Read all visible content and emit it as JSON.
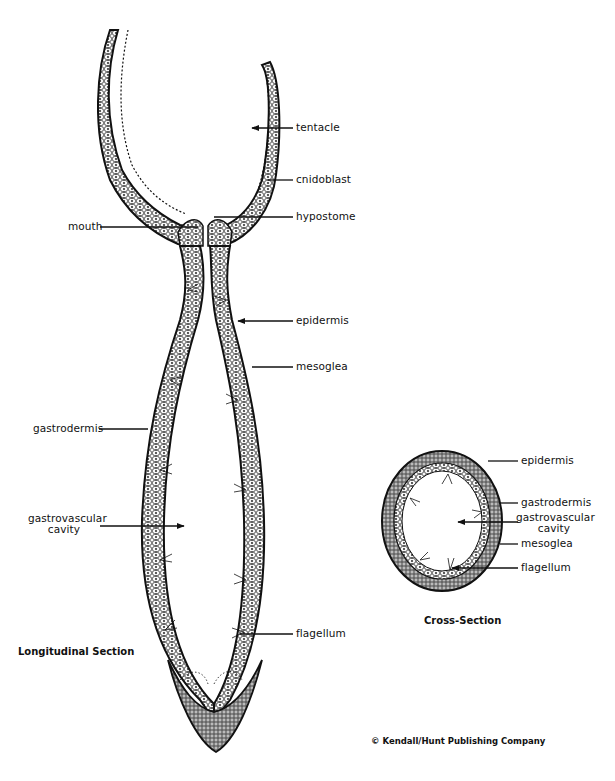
{
  "figure": {
    "longitudinal": {
      "title": "Longitudinal Section",
      "labels": {
        "tentacle": "tentacle",
        "cnidoblast": "cnidoblast",
        "mouth": "mouth",
        "hypostome": "hypostome",
        "epidermis": "epidermis",
        "mesoglea": "mesoglea",
        "gastrodermis": "gastrodermis",
        "gastrovascular_line1": "gastrovascular",
        "gastrovascular_line2": "cavity",
        "flagellum": "flagellum"
      }
    },
    "cross": {
      "title": "Cross-Section",
      "labels": {
        "epidermis": "epidermis",
        "gastrodermis": "gastrodermis",
        "gastrovascular_line1": "gastrovascular",
        "gastrovascular_line2": "cavity",
        "mesoglea": "mesoglea",
        "flagellum": "flagellum"
      }
    },
    "credit": "© Kendall/Hunt Publishing Company",
    "colors": {
      "ink": "#111111",
      "background": "#ffffff",
      "cell_fill": "#f4f4f4"
    }
  }
}
